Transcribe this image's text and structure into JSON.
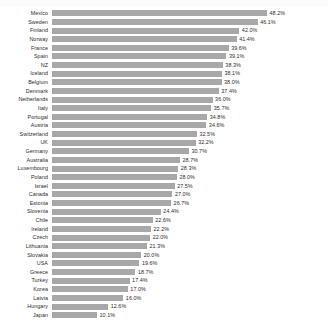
{
  "chart_data": {
    "type": "bar",
    "orientation": "horizontal",
    "title": "",
    "subtitle": "",
    "xlabel": "",
    "ylabel": "",
    "grid": false,
    "legend": null,
    "xlim": [
      0,
      48.2
    ],
    "value_suffix": "%",
    "bar_color": "#a8a8a8",
    "background_color": "#ffffff",
    "text_color": "#2b2b2b",
    "categories": [
      "Mexico",
      "Sweden",
      "Finland",
      "Norway",
      "France",
      "Spain",
      "NZ",
      "Iceland",
      "Belgium",
      "Denmark",
      "Netherlands",
      "Italy",
      "Portugal",
      "Austria",
      "Switzerland",
      "UK",
      "Germany",
      "Australia",
      "Luxembourg",
      "Poland",
      "Israel",
      "Canada",
      "Estonia",
      "Slovenia",
      "Chile",
      "Ireland",
      "Czech",
      "Lithuania",
      "Slovakia",
      "USA",
      "Greece",
      "Turkey",
      "Korea",
      "Latvia",
      "Hungary",
      "Japan"
    ],
    "values": [
      48.2,
      46.1,
      42.0,
      41.4,
      39.6,
      39.1,
      38.3,
      38.1,
      38.0,
      37.4,
      36.0,
      35.7,
      34.8,
      34.6,
      32.5,
      32.2,
      30.7,
      28.7,
      28.3,
      28.0,
      27.5,
      27.0,
      26.7,
      24.4,
      22.6,
      22.2,
      22.0,
      21.3,
      20.0,
      19.6,
      18.7,
      17.4,
      17.0,
      16.0,
      12.6,
      10.1
    ],
    "value_labels": [
      "48.2%",
      "46.1%",
      "42.0%",
      "41.4%",
      "39.6%",
      "39.1%",
      "38.3%",
      "38.1%",
      "38.0%",
      "37.4%",
      "36.0%",
      "35.7%",
      "34.8%",
      "34.6%",
      "32.5%",
      "32.2%",
      "30.7%",
      "28.7%",
      "28.3%",
      "28.0%",
      "27.5%",
      "27.0%",
      "26.7%",
      "24.4%",
      "22.6%",
      "22.2%",
      "22.0%",
      "21.3%",
      "20.0%",
      "19.6%",
      "18.7%",
      "17.4%",
      "17.0%",
      "16.0%",
      "12.6%",
      "10.1%"
    ]
  }
}
